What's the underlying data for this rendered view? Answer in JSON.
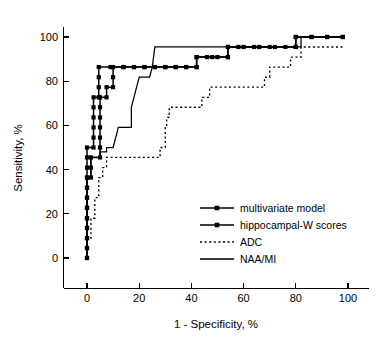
{
  "chart_data": {
    "type": "line",
    "title": "",
    "xlabel": "1 - Specificity, %",
    "ylabel": "Sensitivity, %",
    "xlim": [
      0,
      100
    ],
    "ylim": [
      0,
      100
    ],
    "xticks": [
      0,
      20,
      40,
      60,
      80,
      100
    ],
    "yticks": [
      0,
      20,
      40,
      60,
      80,
      100
    ],
    "xtick_labels": [
      "0",
      "20",
      "40",
      "60",
      "80",
      "100"
    ],
    "ytick_labels": [
      "0",
      "20",
      "40",
      "60",
      "80",
      "100"
    ],
    "grid": false,
    "legend_position": "lower-right-inside",
    "series": [
      {
        "name": "multivariate model",
        "style": "solid-with-square-markers",
        "points": [
          [
            0,
            0
          ],
          [
            0,
            4.5
          ],
          [
            0,
            9
          ],
          [
            0,
            13.6
          ],
          [
            0,
            18
          ],
          [
            0,
            22.7
          ],
          [
            0,
            27.3
          ],
          [
            0,
            31.8
          ],
          [
            0,
            36.4
          ],
          [
            1.5,
            36.4
          ],
          [
            1.5,
            40.9
          ],
          [
            1.5,
            45.5
          ],
          [
            5,
            45.5
          ],
          [
            5,
            50
          ],
          [
            5,
            54.5
          ],
          [
            5,
            59.1
          ],
          [
            5,
            63.6
          ],
          [
            5,
            68.2
          ],
          [
            5,
            72.7
          ],
          [
            7.5,
            72.7
          ],
          [
            7.5,
            77.3
          ],
          [
            10,
            77.3
          ],
          [
            10,
            81.8
          ],
          [
            10,
            86.4
          ],
          [
            14,
            86.4
          ],
          [
            18,
            86.4
          ],
          [
            22,
            86.4
          ],
          [
            26,
            86.4
          ],
          [
            30,
            86.4
          ],
          [
            34,
            86.4
          ],
          [
            38,
            86.4
          ],
          [
            42,
            86.4
          ],
          [
            42,
            90.9
          ],
          [
            46,
            90.9
          ],
          [
            50,
            90.9
          ],
          [
            54,
            90.9
          ],
          [
            54,
            95.5
          ],
          [
            58,
            95.5
          ],
          [
            64,
            95.5
          ],
          [
            70,
            95.5
          ],
          [
            76,
            95.5
          ],
          [
            80,
            95.5
          ],
          [
            80,
            100
          ],
          [
            86,
            100
          ],
          [
            92,
            100
          ],
          [
            98,
            100
          ]
        ]
      },
      {
        "name": "hippocampal-W scores",
        "style": "solid-with-square-markers",
        "points": [
          [
            0,
            0
          ],
          [
            0,
            4.5
          ],
          [
            0,
            9
          ],
          [
            0,
            13.6
          ],
          [
            0,
            18
          ],
          [
            0,
            22.7
          ],
          [
            0,
            27.3
          ],
          [
            0,
            31.8
          ],
          [
            0,
            36.4
          ],
          [
            0,
            40.9
          ],
          [
            0,
            45.5
          ],
          [
            0,
            50
          ],
          [
            2.5,
            50
          ],
          [
            2.5,
            54.5
          ],
          [
            2.5,
            59.1
          ],
          [
            2.5,
            63.6
          ],
          [
            2.5,
            68.2
          ],
          [
            2.5,
            72.7
          ],
          [
            4.5,
            72.7
          ],
          [
            4.5,
            77.3
          ],
          [
            4.5,
            81.8
          ],
          [
            4.5,
            86.4
          ],
          [
            9,
            86.4
          ],
          [
            14,
            86.4
          ],
          [
            18,
            86.4
          ],
          [
            22,
            86.4
          ],
          [
            26,
            86.4
          ],
          [
            30,
            86.4
          ],
          [
            34,
            86.4
          ],
          [
            38,
            86.4
          ],
          [
            42,
            86.4
          ],
          [
            42,
            90.9
          ],
          [
            48,
            90.9
          ],
          [
            54,
            90.9
          ],
          [
            54,
            95.5
          ],
          [
            60,
            95.5
          ],
          [
            66,
            95.5
          ],
          [
            72,
            95.5
          ],
          [
            80,
            95.5
          ],
          [
            80,
            100
          ],
          [
            86,
            100
          ],
          [
            92,
            100
          ],
          [
            98,
            100
          ]
        ]
      },
      {
        "name": "ADC",
        "style": "dotted",
        "points": [
          [
            0,
            0
          ],
          [
            0,
            9
          ],
          [
            1.5,
            9
          ],
          [
            1.5,
            18
          ],
          [
            3,
            18
          ],
          [
            3,
            27.3
          ],
          [
            4.5,
            27.3
          ],
          [
            4.5,
            36.4
          ],
          [
            6,
            36.4
          ],
          [
            6,
            40.9
          ],
          [
            7.5,
            40.9
          ],
          [
            7.5,
            45.5
          ],
          [
            14,
            45.5
          ],
          [
            20,
            45.5
          ],
          [
            25,
            45.5
          ],
          [
            28,
            45.5
          ],
          [
            28,
            50
          ],
          [
            30,
            50
          ],
          [
            30,
            59.1
          ],
          [
            30.5,
            59.1
          ],
          [
            30.5,
            63.6
          ],
          [
            31.5,
            63.6
          ],
          [
            31.5,
            68.2
          ],
          [
            36,
            68.2
          ],
          [
            42,
            68.2
          ],
          [
            44,
            68.2
          ],
          [
            44,
            72.7
          ],
          [
            47,
            72.7
          ],
          [
            47,
            77.3
          ],
          [
            54,
            77.3
          ],
          [
            62,
            77.3
          ],
          [
            68,
            77.3
          ],
          [
            68,
            81.8
          ],
          [
            70,
            81.8
          ],
          [
            70,
            86.4
          ],
          [
            75,
            86.4
          ],
          [
            78,
            86.4
          ],
          [
            78,
            90.9
          ],
          [
            82,
            90.9
          ],
          [
            82,
            95.5
          ],
          [
            88,
            95.5
          ],
          [
            94,
            95.5
          ],
          [
            98,
            95.5
          ]
        ]
      },
      {
        "name": "NAA/MI",
        "style": "solid",
        "points": [
          [
            0,
            0
          ],
          [
            0,
            9
          ],
          [
            0,
            18
          ],
          [
            0,
            27.3
          ],
          [
            0,
            36.4
          ],
          [
            1.5,
            36.4
          ],
          [
            1.5,
            45.5
          ],
          [
            5,
            45.5
          ],
          [
            5,
            48
          ],
          [
            7.5,
            48
          ],
          [
            7.5,
            50
          ],
          [
            10,
            50
          ],
          [
            11,
            54.5
          ],
          [
            12,
            59.1
          ],
          [
            14,
            59.1
          ],
          [
            17,
            59.1
          ],
          [
            17,
            68.2
          ],
          [
            18,
            72.7
          ],
          [
            19,
            77.3
          ],
          [
            20,
            81.8
          ],
          [
            24,
            81.8
          ],
          [
            25,
            86.4
          ],
          [
            25.5,
            90.9
          ],
          [
            26,
            95.5
          ],
          [
            34,
            95.5
          ],
          [
            44,
            95.5
          ],
          [
            54,
            95.5
          ],
          [
            64,
            95.5
          ],
          [
            74,
            95.5
          ],
          [
            82,
            95.5
          ],
          [
            82,
            100
          ],
          [
            90,
            100
          ],
          [
            98,
            100
          ]
        ]
      }
    ]
  },
  "legend": {
    "items": [
      {
        "label": "multivariate model",
        "style": "marked"
      },
      {
        "label": "hippocampal-W scores",
        "style": "marked"
      },
      {
        "label": "ADC",
        "style": "dotted"
      },
      {
        "label": "NAA/MI",
        "style": "solid"
      }
    ]
  }
}
